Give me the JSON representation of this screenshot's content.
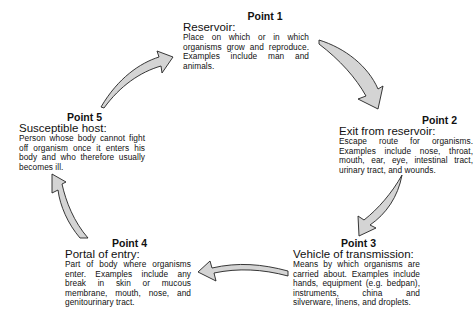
{
  "diagram": {
    "type": "cycle",
    "colors": {
      "arrow_fill": "#d4d4d4",
      "arrow_stroke": "#222222",
      "text": "#111111",
      "background": "#ffffff"
    },
    "points": [
      {
        "label": "Point 1",
        "title": "Reservoir:",
        "description": "Place on which or in which organisms grow and reproduce. Examples include man and animals."
      },
      {
        "label": "Point 2",
        "title": "Exit from reservoir:",
        "description": "Escape route for organisms. Examples include nose, throat, mouth, ear, eye, intestinal tract, urinary tract, and wounds."
      },
      {
        "label": "Point 3",
        "title": "Vehicle of transmission:",
        "description": "Means by which organisms are carried about. Examples include hands, equipment (e.g. bedpan), instruments, china and silverware, linens, and droplets."
      },
      {
        "label": "Point 4",
        "title": "Portal of entry:",
        "description": "Part of body where organisms enter. Examples include any break in skin or mucous membrane, mouth, nose, and genitourinary tract."
      },
      {
        "label": "Point 5",
        "title": "Susceptible host:",
        "description": "Person whose body cannot fight off organism once it enters his body and who therefore usually becomes ill."
      }
    ],
    "arrows": [
      {
        "from": "Point 5",
        "to": "Point 1",
        "icon": "curved-arrow-icon"
      },
      {
        "from": "Point 1",
        "to": "Point 2",
        "icon": "curved-arrow-icon"
      },
      {
        "from": "Point 2",
        "to": "Point 3",
        "icon": "curved-arrow-icon"
      },
      {
        "from": "Point 3",
        "to": "Point 4",
        "icon": "curved-arrow-icon"
      },
      {
        "from": "Point 4",
        "to": "Point 5",
        "icon": "curved-arrow-icon"
      }
    ]
  }
}
